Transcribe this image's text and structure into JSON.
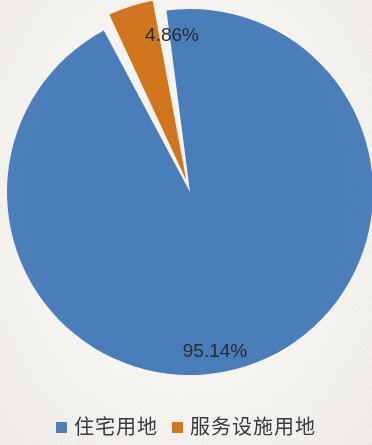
{
  "background_color": "#f7f5f2",
  "chart_data": {
    "type": "pie",
    "title": "",
    "subtitle": "",
    "xlabel": "",
    "ylabel": "",
    "grid": false,
    "legend_position": "bottom-center",
    "categories": [
      "住宅用地",
      "服务设施用地"
    ],
    "values": [
      95.14,
      4.86
    ],
    "value_unit": "%",
    "data_labels": [
      "95.14%",
      "4.86%"
    ],
    "colors": [
      "#4a7ebb",
      "#d2761e"
    ],
    "slices": [
      {
        "label": "住宅用地",
        "value": 95.14,
        "data_label": "95.14%",
        "color": "#4a7ebb",
        "exploded": false
      },
      {
        "label": "服务设施用地",
        "value": 4.86,
        "data_label": "4.86%",
        "color": "#d2761e",
        "exploded": true
      }
    ],
    "start_angle_deg": -9,
    "label_color": "#2b2b2b"
  },
  "legend": {
    "items": [
      {
        "label": "住宅用地",
        "color": "#4a7ebb"
      },
      {
        "label": "服务设施用地",
        "color": "#d2761e"
      }
    ]
  }
}
